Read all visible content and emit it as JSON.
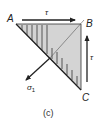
{
  "figure": {
    "caption": "(c)",
    "vertices": {
      "A": {
        "label": "A"
      },
      "B": {
        "label": "B"
      },
      "C": {
        "label": "C"
      }
    },
    "arrows": {
      "shear_top": {
        "label": "τ"
      },
      "shear_right": {
        "label": "τ"
      },
      "principal_stress": {
        "label": "σ",
        "subscript": "1"
      }
    },
    "colors": {
      "fill": "#d4d4d4",
      "stroke": "#222222",
      "hatch": "#555555"
    }
  }
}
